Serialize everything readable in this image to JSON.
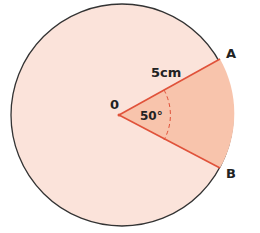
{
  "diagram": {
    "centre_label": "0",
    "radius_label": "5cm",
    "angle_label": "50°",
    "point_a_label": "A",
    "point_b_label": "B",
    "colors": {
      "circle_fill": "#fbe3da",
      "sector_fill": "#f8c4ac",
      "radius_stroke": "#e0523a",
      "circle_stroke": "#333333"
    }
  }
}
